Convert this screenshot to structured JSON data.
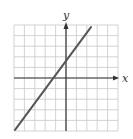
{
  "chart_data": {
    "type": "line",
    "title": "",
    "xlabel": "x",
    "ylabel": "y",
    "xlim": [
      -5,
      5
    ],
    "ylim": [
      -5,
      5
    ],
    "grid": true,
    "grid_step": 1,
    "tick_labels": false,
    "series": [
      {
        "name": "line",
        "x": [
          -4.9,
          2.4
        ],
        "y": [
          -4.9,
          4.8
        ],
        "equation_estimate": "y ≈ 1.33x + 1.5"
      }
    ],
    "colors": {
      "grid": "#c8c8c8",
      "axis": "#333333",
      "line": "#555555"
    }
  }
}
